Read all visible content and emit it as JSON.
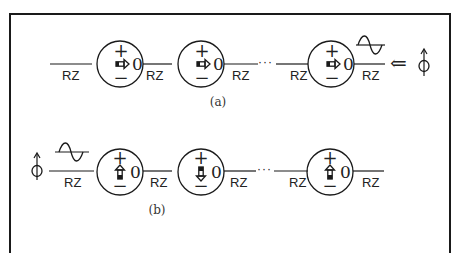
{
  "figure": {
    "panels": [
      {
        "id": "a",
        "caption": "(a)",
        "chain_label": "RZ",
        "ellipsis": "···",
        "segments": [
          "RZ",
          "RZ",
          "RZ",
          "RZ",
          "RZ"
        ],
        "nodes": [
          {
            "plus": "+",
            "minus": "−",
            "value": "0",
            "arrow": "right"
          },
          {
            "plus": "+",
            "minus": "−",
            "value": "0",
            "arrow": "right"
          },
          {
            "plus": "+",
            "minus": "−",
            "value": "0",
            "arrow": "right"
          }
        ],
        "input_side": "right",
        "input_arrow": "⇐",
        "phi_symbol": "ϕ",
        "waveform": "sine-pulse"
      },
      {
        "id": "b",
        "caption": "(b)",
        "chain_label": "RZ",
        "ellipsis": "···",
        "segments": [
          "RZ",
          "RZ",
          "RZ",
          "RZ",
          "RZ"
        ],
        "nodes": [
          {
            "plus": "+",
            "minus": "−",
            "value": "0",
            "arrow": "up"
          },
          {
            "plus": "+",
            "minus": "−",
            "value": "0",
            "arrow": "down"
          },
          {
            "plus": "+",
            "minus": "−",
            "value": "0",
            "arrow": "up"
          }
        ],
        "input_side": "left",
        "phi_symbol": "ϕ",
        "waveform": "sine-pulse"
      }
    ],
    "colors": {
      "stroke": "#1a1a1a",
      "text": "#222222",
      "background": "#ffffff"
    }
  }
}
